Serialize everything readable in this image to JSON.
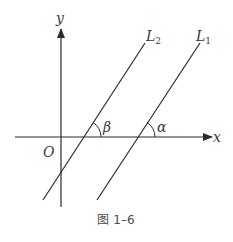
{
  "figure": {
    "caption": "图 1–6",
    "axes": {
      "x_label": "x",
      "y_label": "y",
      "origin_label": "O"
    },
    "lines": [
      {
        "name": "L1",
        "label_main": "L",
        "label_sub": "1",
        "angle_label": "α"
      },
      {
        "name": "L2",
        "label_main": "L",
        "label_sub": "2",
        "angle_label": "β"
      }
    ],
    "colors": {
      "stroke": "#2b2b2b",
      "text": "#3a3a3a"
    }
  }
}
